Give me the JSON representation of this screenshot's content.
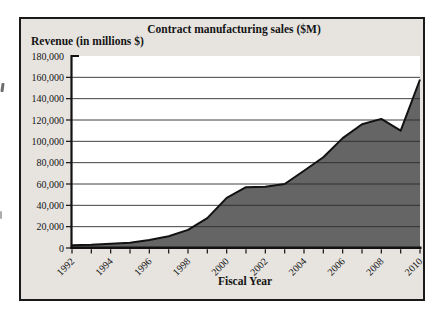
{
  "frame": {
    "page_background": "#ffffff",
    "box_background": "#e7e4e0",
    "border_color": "#1a1a1a"
  },
  "chart_data": {
    "type": "area",
    "title": "Contract manufacturing sales ($M)",
    "y_axis_title": "Revenue (in millions $)",
    "xlabel": "Fiscal Year",
    "x": [
      1992,
      1993,
      1994,
      1995,
      1996,
      1997,
      1998,
      1999,
      2000,
      2001,
      2002,
      2003,
      2004,
      2005,
      2006,
      2007,
      2008,
      2009,
      2010
    ],
    "values": [
      2500,
      3000,
      4000,
      5000,
      7500,
      11000,
      17000,
      28000,
      47000,
      57000,
      57500,
      60000,
      72500,
      85000,
      103000,
      116000,
      121000,
      110000,
      158000
    ],
    "series_name": "Contract manufacturing sales",
    "ylim": [
      0,
      180000
    ],
    "y_tick_step": 20000,
    "y_ticks": [
      0,
      20000,
      40000,
      60000,
      80000,
      100000,
      120000,
      140000,
      160000,
      180000
    ],
    "y_tick_labels": [
      "0",
      "20,000",
      "40,000",
      "60,000",
      "80,000",
      "100,000",
      "120,000",
      "140,000",
      "160,000",
      "180,000"
    ],
    "x_minor_tick_every": 1,
    "x_label_years": [
      "1992",
      "1994",
      "1996",
      "1998",
      "2000",
      "2002",
      "2004",
      "2006",
      "2008",
      "2010"
    ],
    "grid": "horizontal major, none at 180,000",
    "legend": "none",
    "plot_bg": "#ffffff",
    "fill_color": "#656565",
    "line_color": "#121212",
    "grid_color": "#2d2d2d",
    "axis_color": "#111111"
  }
}
